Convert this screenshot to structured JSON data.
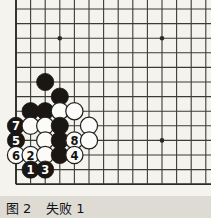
{
  "figure": {
    "caption_label": "图",
    "caption_number": "2",
    "caption_title": "失败",
    "caption_title_number": "1",
    "caption_full": "图2  失败1"
  },
  "board": {
    "type": "go-board-diagram",
    "description": "Go (weiqi) life-and-death problem diagram, lower-left corner",
    "cols": 13,
    "rows": 13,
    "line_color": "#3b3b38",
    "edge_color": "#2a2a28",
    "board_bg": "#f5f3ee",
    "x0": 16,
    "y0": 9,
    "x_step": 14.6,
    "y_step": 14.6,
    "stone_radius": 8.6,
    "star_points": [
      {
        "col": 3,
        "row": 2
      },
      {
        "col": 10,
        "row": 2
      },
      {
        "col": 10,
        "row": 9
      }
    ],
    "black_color": "#1a1613",
    "white_color": "#fbfbf9",
    "white_outline": "#23211f"
  },
  "stones": [
    {
      "id": "b-a",
      "color": "black",
      "col": 2,
      "row": 5,
      "label": ""
    },
    {
      "id": "b-b",
      "color": "black",
      "col": 3,
      "row": 6,
      "label": ""
    },
    {
      "id": "b-c",
      "color": "black",
      "col": 1,
      "row": 7,
      "label": ""
    },
    {
      "id": "b-d",
      "color": "black",
      "col": 2,
      "row": 7,
      "label": ""
    },
    {
      "id": "w-a",
      "color": "white",
      "col": 3,
      "row": 7,
      "label": ""
    },
    {
      "id": "w-b",
      "color": "white",
      "col": 4,
      "row": 7,
      "label": ""
    },
    {
      "id": "b-7",
      "color": "black",
      "col": 0,
      "row": 8,
      "label": "7"
    },
    {
      "id": "w-c",
      "color": "white",
      "col": 1,
      "row": 8,
      "label": ""
    },
    {
      "id": "w-d",
      "color": "white",
      "col": 2,
      "row": 8,
      "label": ""
    },
    {
      "id": "b-e",
      "color": "black",
      "col": 3,
      "row": 8,
      "label": ""
    },
    {
      "id": "w-e",
      "color": "white",
      "col": 5,
      "row": 8,
      "label": ""
    },
    {
      "id": "b-5",
      "color": "black",
      "col": 0,
      "row": 9,
      "label": "5"
    },
    {
      "id": "w-f",
      "color": "white",
      "col": 2,
      "row": 9,
      "label": ""
    },
    {
      "id": "b-f",
      "color": "black",
      "col": 3,
      "row": 9,
      "label": ""
    },
    {
      "id": "w-8",
      "color": "white",
      "col": 4,
      "row": 9,
      "label": "8"
    },
    {
      "id": "w-g",
      "color": "white",
      "col": 5,
      "row": 9,
      "label": ""
    },
    {
      "id": "w-6",
      "color": "white",
      "col": 0,
      "row": 10,
      "label": "6"
    },
    {
      "id": "w-2",
      "color": "white",
      "col": 1,
      "row": 10,
      "label": "2"
    },
    {
      "id": "w-h",
      "color": "white",
      "col": 2,
      "row": 10,
      "label": ""
    },
    {
      "id": "b-g",
      "color": "black",
      "col": 3,
      "row": 10,
      "label": ""
    },
    {
      "id": "w-4",
      "color": "white",
      "col": 4,
      "row": 10,
      "label": "4"
    },
    {
      "id": "b-1",
      "color": "black",
      "col": 1,
      "row": 11,
      "label": "1"
    },
    {
      "id": "b-3",
      "color": "black",
      "col": 2,
      "row": 11,
      "label": "3"
    }
  ]
}
